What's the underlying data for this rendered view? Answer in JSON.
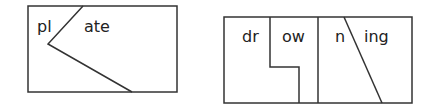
{
  "diagrams": [
    {
      "name": "plate",
      "pieces": [
        {
          "text": "pl",
          "x": 37,
          "y": 32
        },
        {
          "text": "ate",
          "x": 84,
          "y": 32
        }
      ]
    },
    {
      "name": "drowning",
      "pieces": [
        {
          "text": "dr",
          "x": 242,
          "y": 42
        },
        {
          "text": "ow",
          "x": 282,
          "y": 42
        },
        {
          "text": "n",
          "x": 335,
          "y": 42
        },
        {
          "text": "ing",
          "x": 364,
          "y": 42
        }
      ]
    }
  ],
  "colors": {
    "stroke": "#333333",
    "background": "#ffffff"
  }
}
